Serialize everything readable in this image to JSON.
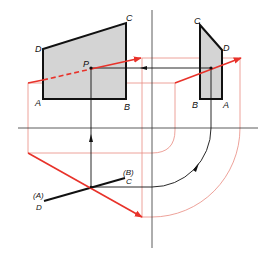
{
  "diagram": {
    "type": "orthographic-projection",
    "colors": {
      "outline": "#111111",
      "fill": "#d4d4d4",
      "red": "#e8322a",
      "red_thin": "#e88a80",
      "axis": "#333333"
    },
    "front_view": {
      "vertices": {
        "A": [
          43,
          99
        ],
        "B": [
          126,
          99
        ],
        "C": [
          126,
          23
        ],
        "D": [
          43,
          49
        ]
      },
      "labels": {
        "A": "A",
        "B": "B",
        "C": "C",
        "D": "D",
        "P": "P"
      },
      "point_P": [
        91,
        68
      ]
    },
    "side_view": {
      "vertices": {
        "B": [
          200,
          99
        ],
        "A": [
          222,
          99
        ],
        "D": [
          222,
          50
        ],
        "C": [
          200,
          25
        ]
      },
      "labels": {
        "A": "A",
        "B": "B",
        "C": "C",
        "D": "D"
      },
      "point_P": [
        211,
        68
      ]
    },
    "top_view": {
      "edge_start": [
        44,
        201
      ],
      "edge_end": [
        125,
        178
      ],
      "point_P": [
        91,
        187
      ],
      "labels": {
        "AD_paren": "(A)",
        "AD": "D",
        "BC_paren": "(B)",
        "BC": "C"
      }
    },
    "axes": {
      "horizontal": {
        "y": 128,
        "x1": 18,
        "x2": 258
      },
      "vertical": {
        "x": 152,
        "y1": 10,
        "y2": 248
      }
    }
  }
}
